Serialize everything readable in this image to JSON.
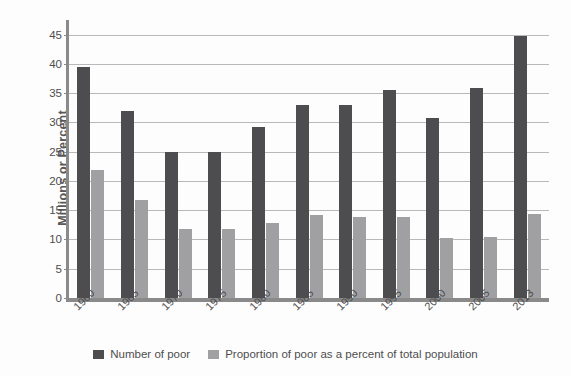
{
  "chart_data": {
    "type": "bar",
    "title": "",
    "subtitle": "",
    "xlabel": "",
    "ylabel": "Millions or Percent",
    "ylim": [
      0,
      47.5
    ],
    "ytick_step": 5,
    "yticks": [
      0,
      5,
      10,
      15,
      20,
      25,
      30,
      35,
      40,
      45
    ],
    "ytick_labels": [
      "0",
      "5",
      "10",
      "15",
      "20",
      "25",
      "30",
      "35",
      "40",
      "45"
    ],
    "grid": true,
    "legend_position": "bottom",
    "categories": [
      "1960",
      "1965",
      "1970",
      "1975",
      "1980",
      "1985",
      "1990",
      "1995",
      "2000",
      "2005",
      "2013"
    ],
    "series": [
      {
        "name": "Number of poor",
        "color": "#4d4d4f",
        "values": [
          39.5,
          32.0,
          25.0,
          25.0,
          29.3,
          33.0,
          33.0,
          35.5,
          30.8,
          35.9,
          44.7
        ]
      },
      {
        "name": "Proportion of poor as a percent of total population",
        "color": "#a0a0a2",
        "values": [
          21.9,
          16.8,
          11.8,
          11.8,
          12.8,
          14.2,
          13.9,
          13.9,
          10.2,
          10.4,
          14.4
        ]
      }
    ]
  },
  "legend": {
    "items": [
      {
        "label": "Number of poor",
        "swatch": "dark-swatch"
      },
      {
        "label": "Proportion of poor as a percent of total population",
        "swatch": "light-swatch"
      }
    ]
  },
  "axes": {
    "y_title": "Millions or Percent"
  }
}
